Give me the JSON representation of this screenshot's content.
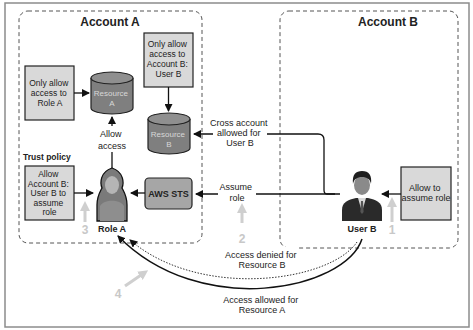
{
  "diagram": {
    "accounts": [
      {
        "id": "account-a",
        "title": "Account A"
      },
      {
        "id": "account-b",
        "title": "Account B"
      }
    ],
    "policy_boxes": {
      "role_a_policy": [
        "Only allow",
        "access to",
        "Role A"
      ],
      "account_b_policy": [
        "Only allow",
        "access to",
        "Account B:",
        "User B"
      ],
      "trust_policy_label": "Trust policy",
      "trust_policy": [
        "Allow",
        "Account B:",
        "User B to",
        "assume",
        "role"
      ],
      "user_b_policy": [
        "Allow to",
        "assume role"
      ]
    },
    "resources": [
      {
        "id": "resource-a",
        "lines": [
          "Resource",
          "A"
        ]
      },
      {
        "id": "resource-b",
        "lines": [
          "Resource",
          "B"
        ]
      }
    ],
    "sts": {
      "label": "AWS STS"
    },
    "actors": {
      "role_a": "Role A",
      "user_b": "User B"
    },
    "arrow_labels": {
      "allow_access": [
        "Allow",
        "access"
      ],
      "cross_account": [
        "Cross account",
        "allowed for",
        "User B"
      ],
      "assume_role": [
        "Assume",
        "role"
      ],
      "access_denied": [
        "Access denied for",
        "Resource B"
      ],
      "access_allowed": [
        "Access allowed for",
        "Resource A"
      ]
    },
    "steps": [
      "1",
      "2",
      "3",
      "4"
    ],
    "colors": {
      "policy_box_fill": "#d9d9d9",
      "resource_fill": "#7f7f7f",
      "sts_fill": "#a6a6a6",
      "step_marker": "#c8c8c8",
      "frame_border": "#8c8c8c"
    }
  }
}
